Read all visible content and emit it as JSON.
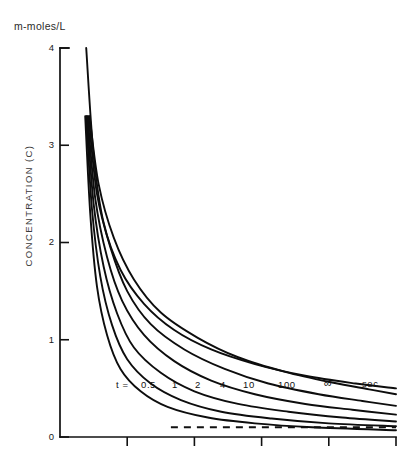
{
  "figure": {
    "unit_label": "m-moles/L",
    "y_axis_title": "CONCENTRATION (C)",
    "background_color": "#ffffff",
    "line_color": "#0d0d0d"
  },
  "axes": {
    "y_ticks": [
      "4",
      "3",
      "2",
      "1",
      "0"
    ],
    "y_tick_values": [
      4,
      3,
      2,
      1,
      0
    ],
    "x_tick_labels": [
      "",
      "",
      "",
      "",
      ""
    ],
    "x_tick_count": 5
  },
  "labels": {
    "t_equals": "t =",
    "unit_sec": "sec",
    "curve_labels": [
      "0.5",
      "1",
      "2",
      "4",
      "10",
      "100",
      "∞"
    ]
  },
  "chart_data": {
    "type": "line",
    "title": "",
    "subtitle": "",
    "xlabel": "",
    "ylabel": "CONCENTRATION (C)",
    "y_unit": "m-moles/L",
    "ylim": [
      0,
      4
    ],
    "xlim": [
      0,
      1
    ],
    "grid": false,
    "legend_position": "inline-on-curves",
    "y_ticks": [
      0,
      1,
      2,
      3,
      4
    ],
    "x_ticks": [
      0.2,
      0.4,
      0.6,
      0.8,
      1.0
    ],
    "x_tick_labels_shown": false,
    "annotations": [
      {
        "text": "t =",
        "x": 0.11,
        "y": 0.27
      },
      {
        "text": "sec",
        "x": 0.85,
        "y": 0.3
      },
      {
        "text": "dashed asymptote",
        "y": 0.1,
        "x_start": 0.33,
        "x_end": 1.0
      }
    ],
    "asymptote": {
      "value": 0.1,
      "style": "dashed"
    },
    "series": [
      {
        "name": "0.5",
        "label": "0.5",
        "t_sec": 0.5,
        "x": [
          0.075,
          0.09,
          0.11,
          0.14,
          0.18,
          0.24,
          0.32,
          0.44,
          0.58,
          0.75,
          1.0
        ],
        "values": [
          3.3,
          2.3,
          1.55,
          1.05,
          0.7,
          0.47,
          0.31,
          0.2,
          0.14,
          0.1,
          0.07
        ]
      },
      {
        "name": "1",
        "label": "1",
        "t_sec": 1,
        "x": [
          0.078,
          0.095,
          0.12,
          0.155,
          0.2,
          0.27,
          0.36,
          0.48,
          0.63,
          0.8,
          1.0
        ],
        "values": [
          3.3,
          2.35,
          1.65,
          1.15,
          0.8,
          0.55,
          0.38,
          0.26,
          0.19,
          0.14,
          0.11
        ]
      },
      {
        "name": "2",
        "label": "2",
        "t_sec": 2,
        "x": [
          0.08,
          0.1,
          0.13,
          0.17,
          0.22,
          0.3,
          0.4,
          0.53,
          0.68,
          0.84,
          1.0
        ],
        "values": [
          3.3,
          2.4,
          1.75,
          1.27,
          0.92,
          0.66,
          0.47,
          0.34,
          0.26,
          0.2,
          0.16
        ]
      },
      {
        "name": "4",
        "label": "4",
        "t_sec": 4,
        "x": [
          0.082,
          0.105,
          0.14,
          0.185,
          0.25,
          0.34,
          0.45,
          0.58,
          0.73,
          0.87,
          1.0
        ],
        "values": [
          3.3,
          2.45,
          1.85,
          1.4,
          1.05,
          0.78,
          0.58,
          0.44,
          0.34,
          0.28,
          0.23
        ]
      },
      {
        "name": "10",
        "label": "10",
        "t_sec": 10,
        "x": [
          0.085,
          0.11,
          0.15,
          0.2,
          0.27,
          0.37,
          0.49,
          0.62,
          0.77,
          0.9,
          1.0
        ],
        "values": [
          3.3,
          2.5,
          1.95,
          1.5,
          1.16,
          0.9,
          0.7,
          0.55,
          0.44,
          0.37,
          0.32
        ]
      },
      {
        "name": "100",
        "label": "100",
        "t_sec": 100,
        "x": [
          0.088,
          0.115,
          0.16,
          0.22,
          0.3,
          0.41,
          0.53,
          0.67,
          0.81,
          0.92,
          1.0
        ],
        "values": [
          3.3,
          2.6,
          2.05,
          1.62,
          1.28,
          1.02,
          0.82,
          0.67,
          0.56,
          0.49,
          0.44
        ]
      },
      {
        "name": "∞",
        "label": "∞",
        "t_sec": null,
        "x": [
          0.078,
          0.1,
          0.13,
          0.18,
          0.25,
          0.34,
          0.45,
          0.58,
          0.73,
          0.88,
          1.0
        ],
        "values": [
          4.0,
          2.9,
          2.2,
          1.72,
          1.37,
          1.1,
          0.9,
          0.75,
          0.63,
          0.55,
          0.5
        ]
      }
    ]
  }
}
